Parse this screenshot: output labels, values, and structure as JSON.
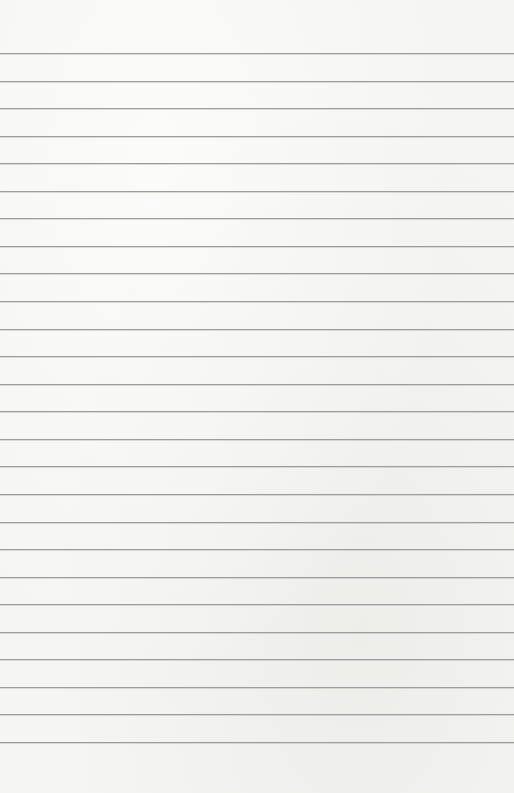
{
  "paper": {
    "type": "lined-paper",
    "background_color": "#f5f5f3",
    "line_color": "#9d9d9b",
    "line_count": 26,
    "first_line_y": 53,
    "line_spacing": 27.56
  }
}
